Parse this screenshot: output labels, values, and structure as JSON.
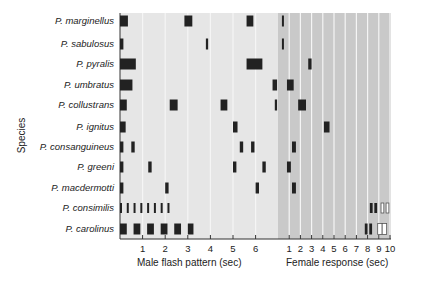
{
  "chart_data": {
    "type": "timeline",
    "ylabel": "Species",
    "xlabel_left": "Male flash pattern (sec)",
    "xlabel_right": "Female response (sec)",
    "male_ticks": [
      "1",
      "2",
      "3",
      "4",
      "5",
      "6"
    ],
    "female_ticks": [
      "1",
      "2",
      "3",
      "4",
      "5",
      "6",
      "7",
      "8",
      "9",
      "10"
    ],
    "male_xlim": [
      0,
      7
    ],
    "female_xlim": [
      0,
      10
    ],
    "species": [
      {
        "name": "P. marginellus",
        "male": [
          [
            0,
            0.35
          ],
          [
            2.85,
            3.2
          ],
          [
            5.6,
            5.9
          ]
        ],
        "female": [
          [
            0.35,
            0.5
          ]
        ]
      },
      {
        "name": "P. sabulosus",
        "male": [
          [
            0,
            0.15
          ],
          [
            3.8,
            3.9
          ]
        ],
        "female": [
          [
            0.35,
            0.45
          ]
        ]
      },
      {
        "name": "P. pyralis",
        "male": [
          [
            0,
            0.7
          ],
          [
            5.6,
            6.3
          ]
        ],
        "female": [
          [
            2.7,
            3.0
          ]
        ]
      },
      {
        "name": "P. umbratus",
        "male": [
          [
            0,
            0.55
          ],
          [
            6.75,
            6.95
          ]
        ],
        "female": [
          [
            0.8,
            1.4
          ]
        ]
      },
      {
        "name": "P. collustrans",
        "male": [
          [
            0,
            0.3
          ],
          [
            2.2,
            2.55
          ],
          [
            4.45,
            4.75
          ],
          [
            6.85,
            6.95
          ]
        ],
        "female": [
          [
            1.8,
            2.5
          ]
        ]
      },
      {
        "name": "P. ignitus",
        "male": [
          [
            0,
            0.25
          ],
          [
            5.0,
            5.2
          ]
        ],
        "female": [
          [
            4.1,
            4.6
          ]
        ]
      },
      {
        "name": "P. consanguineus",
        "male": [
          [
            0,
            0.15
          ],
          [
            0.5,
            0.65
          ],
          [
            5.3,
            5.45
          ],
          [
            5.8,
            5.95
          ]
        ],
        "female": [
          [
            1.25,
            1.6
          ]
        ]
      },
      {
        "name": "P. greeni",
        "male": [
          [
            0,
            0.15
          ],
          [
            1.25,
            1.4
          ],
          [
            5.0,
            5.15
          ],
          [
            6.3,
            6.45
          ]
        ],
        "female": [
          [
            0.8,
            1.15
          ]
        ]
      },
      {
        "name": "P. macdermotti",
        "male": [
          [
            0,
            0.15
          ],
          [
            2.0,
            2.15
          ],
          [
            6.0,
            6.15
          ]
        ],
        "female": [
          [
            1.25,
            1.6
          ]
        ]
      },
      {
        "name": "P. consimilis",
        "male": [
          [
            0,
            0.06
          ],
          [
            0.3,
            0.36
          ],
          [
            0.6,
            0.66
          ],
          [
            0.9,
            0.96
          ],
          [
            1.2,
            1.26
          ],
          [
            1.5,
            1.56
          ],
          [
            1.8,
            1.86
          ],
          [
            2.1,
            2.16
          ]
        ],
        "female": [
          [
            8.2,
            8.45
          ],
          [
            8.6,
            8.85
          ]
        ],
        "female_open": [
          [
            9.2,
            9.45
          ],
          [
            9.65,
            9.9
          ]
        ]
      },
      {
        "name": "P. carolinus",
        "male": [
          [
            0,
            0.3
          ],
          [
            0.6,
            0.9
          ],
          [
            1.2,
            1.5
          ],
          [
            1.8,
            2.1
          ],
          [
            2.4,
            2.7
          ],
          [
            3.0,
            3.25
          ]
        ],
        "female": [
          [
            7.75,
            8.0
          ],
          [
            8.15,
            8.4
          ]
        ],
        "female_open": [
          [
            8.9,
            9.3
          ],
          [
            9.3,
            9.7
          ]
        ]
      }
    ],
    "colors": {
      "male_bg": "#e6e6e6",
      "female_bg": "#c9c9c9",
      "bar": "#222222",
      "grid": "#f5f5f5"
    }
  }
}
